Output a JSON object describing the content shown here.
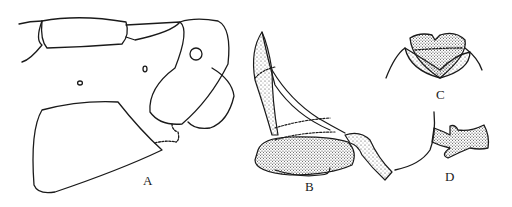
{
  "figure": {
    "panels": [
      {
        "id": "A",
        "label": "A"
      },
      {
        "id": "B",
        "label": "B"
      },
      {
        "id": "C",
        "label": "C"
      },
      {
        "id": "D",
        "label": "D"
      }
    ],
    "colors": {
      "ink": "#1a1a1a",
      "background": "#ffffff",
      "stipple": "#3a3a3a"
    }
  }
}
